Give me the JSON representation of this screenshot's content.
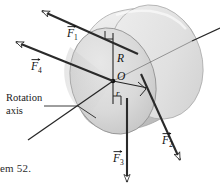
{
  "figure": {
    "caption": "em 52.",
    "rotation_axis": {
      "line1": "Rotation",
      "line2": "axis"
    },
    "center_label": "O",
    "radius_label": "R",
    "small_radius_label": "r",
    "forces": [
      {
        "name": "F1",
        "base": "F",
        "sub": "1",
        "direction": "up-left"
      },
      {
        "name": "F2",
        "base": "F",
        "sub": "2",
        "direction": "down-right"
      },
      {
        "name": "F3",
        "base": "F",
        "sub": "3",
        "direction": "down"
      },
      {
        "name": "F4",
        "base": "F",
        "sub": "4",
        "direction": "up-left"
      }
    ],
    "colors": {
      "ink": "#1a1a1a",
      "line": "#2a2a2a",
      "cylinder_light": "#e9e9e9",
      "cylinder_mid": "#d6d6d6",
      "cylinder_dark": "#bdbdbd",
      "face_shadow": "#c9c9c9",
      "background": "#ffffff"
    }
  }
}
